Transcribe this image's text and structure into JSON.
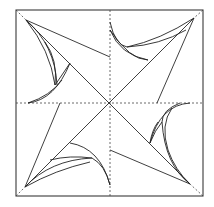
{
  "figure": {
    "width": 214,
    "height": 207,
    "stroke_color": "#2a2a2a",
    "background": "#ffffff",
    "frame": {
      "x1": 16,
      "y1": 10,
      "x2": 203,
      "y2": 196
    },
    "center": {
      "x": 110,
      "y": 103
    }
  }
}
